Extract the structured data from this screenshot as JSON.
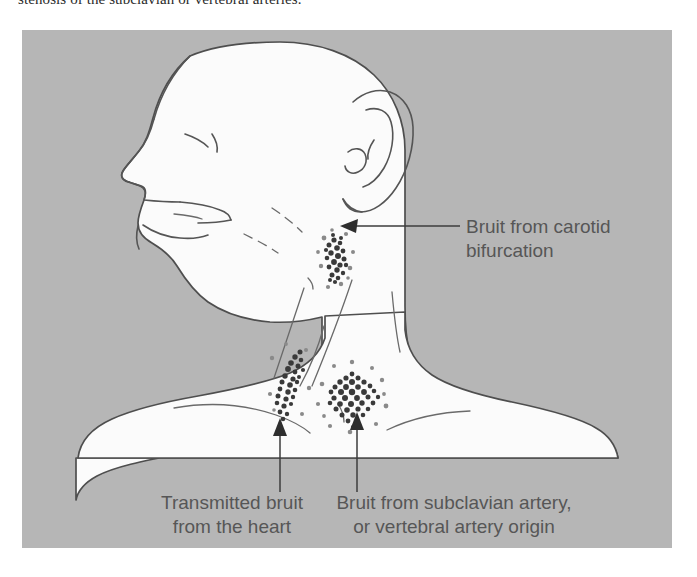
{
  "caption": {
    "text": "stenosis of the subclavian or vertebral arteries."
  },
  "figure": {
    "background_color": "#b6b6b6",
    "body_color": "#fbfbfb",
    "ink_color": "#555555",
    "label_color": "#565656",
    "title": "Lateral head and neck illustration showing auscultation sites for vascular bruits",
    "labels": [
      {
        "id": "carotid",
        "line1": "Bruit from carotid",
        "line2": "bifurcation"
      },
      {
        "id": "heart",
        "line1": "Transmitted bruit",
        "line2": "from the heart"
      },
      {
        "id": "subclavian",
        "line1": "Bruit from subclavian artery,",
        "line2": "or vertebral artery origin"
      }
    ],
    "bruit_sites": [
      {
        "id": "carotid-bifurcation-stipple",
        "name": "carotid bifurcation bruit"
      },
      {
        "id": "transmitted-heart-stipple",
        "name": "transmitted cardiac bruit"
      },
      {
        "id": "subclavian-vertebral-stipple",
        "name": "subclavian / vertebral origin bruit"
      }
    ]
  }
}
